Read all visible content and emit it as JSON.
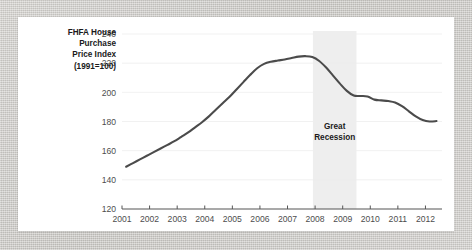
{
  "figure": {
    "background_color": "#ffffff",
    "frame_color": "#c9c7c3",
    "line_color": "#4b4b4b",
    "band_color": "#eeeeee"
  },
  "chart_data": {
    "type": "line",
    "title": "",
    "ylabel": "FHFA House Purchase Price Index (1991=100)",
    "ylabel_lines": [
      "FHFA House",
      "Purchase",
      "Price Index",
      "(1991=100)"
    ],
    "xlabel": "",
    "xlim": [
      2001.0,
      2012.6
    ],
    "ylim": [
      120,
      240
    ],
    "grid": true,
    "grid_axis": "y",
    "legend": false,
    "y_ticks": [
      120,
      140,
      160,
      180,
      200,
      220,
      240
    ],
    "y_tick_labels": [
      "120",
      "140",
      "160",
      "180",
      "200",
      "220",
      "240"
    ],
    "x_ticks": [
      2001,
      2002,
      2003,
      2004,
      2005,
      2006,
      2007,
      2008,
      2009,
      2010,
      2011,
      2012
    ],
    "x_tick_labels": [
      "2001",
      "2002",
      "2003",
      "2004",
      "2005",
      "2006",
      "2007",
      "2008",
      "2009",
      "2010",
      "2011",
      "2012"
    ],
    "annotations": [
      {
        "type": "vspan",
        "label": "Great Recession",
        "label_lines": [
          "Great",
          "Recession"
        ],
        "x_start": 2007.92,
        "x_end": 2009.5,
        "color": "#eeeeee",
        "label_y": 175
      }
    ],
    "series": [
      {
        "name": "FHFA House Purchase Price Index",
        "color": "#4b4b4b",
        "x": [
          2001.15,
          2001.4,
          2001.65,
          2001.9,
          2002.15,
          2002.4,
          2002.65,
          2002.9,
          2003.15,
          2003.4,
          2003.65,
          2003.9,
          2004.15,
          2004.4,
          2004.65,
          2004.9,
          2005.15,
          2005.4,
          2005.65,
          2005.9,
          2006.15,
          2006.4,
          2006.65,
          2006.9,
          2007.15,
          2007.4,
          2007.65,
          2007.9,
          2008.15,
          2008.4,
          2008.65,
          2008.9,
          2009.15,
          2009.4,
          2009.65,
          2009.9,
          2010.15,
          2010.4,
          2010.65,
          2010.9,
          2011.15,
          2011.4,
          2011.65,
          2011.9,
          2012.15,
          2012.4
        ],
        "y": [
          149.0,
          151.5,
          154.0,
          156.5,
          159.0,
          161.5,
          164.0,
          166.5,
          169.5,
          172.5,
          176.0,
          179.5,
          183.5,
          188.0,
          192.5,
          197.0,
          202.0,
          207.0,
          212.0,
          216.5,
          219.5,
          221.0,
          221.8,
          222.5,
          223.5,
          224.5,
          224.8,
          224.2,
          221.5,
          217.0,
          211.5,
          206.0,
          201.0,
          197.8,
          197.5,
          197.2,
          195.0,
          194.5,
          194.0,
          193.0,
          190.5,
          187.0,
          183.5,
          181.0,
          180.0,
          180.3
        ]
      }
    ],
    "notable_values": {
      "start_2001": 149,
      "peak": 224.8,
      "peak_year": 2007.65,
      "trough_post_recession": 180.0,
      "trough_year": 2012.15,
      "end_value": 184.5
    }
  }
}
